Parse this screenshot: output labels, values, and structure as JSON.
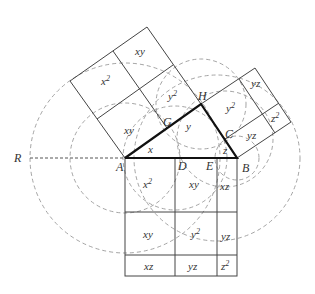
{
  "figure": {
    "title": "",
    "caption": "",
    "colors": {
      "stroke": "#444444",
      "thick": "#111111",
      "dashed": "#999999",
      "text": "#333333"
    }
  },
  "points": {
    "A": "A",
    "B": "B",
    "C": "C",
    "D": "D",
    "E": "E",
    "G": "G",
    "H": "H",
    "R": "R"
  },
  "segments": {
    "x": "x",
    "y": "y",
    "z": "z"
  },
  "square_left": {
    "cells": [
      "xy",
      "x 2",
      "xy",
      "y 2"
    ]
  },
  "square_right": {
    "cells": [
      "yz",
      "y 2",
      "z 2",
      "yz"
    ]
  },
  "square_bottom": {
    "cells": [
      "x 2",
      "xy",
      "xz",
      "xy",
      "y 2",
      "yz",
      "xz",
      "yz",
      "z 2"
    ]
  }
}
